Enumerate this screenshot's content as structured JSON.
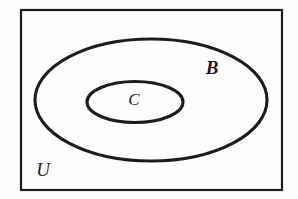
{
  "diagram": {
    "type": "venn-diagram",
    "background_color": "#fefefe",
    "stroke_color": "#201b1a",
    "universe": {
      "name": "universal-set",
      "label": "U",
      "shape": "rectangle",
      "x": 20,
      "y": 9,
      "width": 263,
      "height": 182,
      "stroke_width": 2,
      "label_x": 43,
      "label_y": 172
    },
    "sets": [
      {
        "name": "set-b",
        "label": "B",
        "shape": "ellipse",
        "cx": 151,
        "cy": 100,
        "rx": 116,
        "ry": 61,
        "stroke_width": 3,
        "label_x": 212,
        "label_y": 70
      },
      {
        "name": "set-c",
        "label": "C",
        "shape": "ellipse",
        "cx": 135,
        "cy": 102,
        "rx": 48,
        "ry": 20,
        "stroke_width": 3,
        "label_x": 134,
        "label_y": 101
      }
    ]
  }
}
